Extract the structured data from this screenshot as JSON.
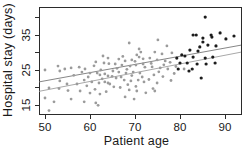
{
  "chart_data": {
    "type": "scatter",
    "title": "",
    "xlabel": "Patient age",
    "ylabel": "Hospital stay (days)",
    "xlim": [
      48.5,
      93.5
    ],
    "ylim": [
      12,
      43
    ],
    "x_ticks": [
      50,
      60,
      70,
      80,
      90
    ],
    "y_ticks": [
      15,
      20,
      25,
      30,
      35,
      40
    ],
    "y_labeled_ticks": [
      15,
      25,
      35
    ],
    "grid": false,
    "legend": "none",
    "frame_color": "#2b2b2b",
    "text_color": "#1a1a1a",
    "series": [
      {
        "name": "younger-patients-gray",
        "color": "#9b9b9b",
        "marker": "circle",
        "marker_radius": 1.4,
        "points": [
          [
            50.0,
            25.0
          ],
          [
            52.9,
            26.1
          ],
          [
            53.3,
            24.7
          ],
          [
            54.4,
            25.3
          ],
          [
            55.8,
            25.6
          ],
          [
            53.3,
            21.9
          ],
          [
            54.9,
            21.0
          ],
          [
            50.9,
            19.9
          ],
          [
            53.1,
            19.7
          ],
          [
            55.1,
            19.1
          ],
          [
            50.0,
            17.0
          ],
          [
            52.0,
            15.9
          ],
          [
            55.8,
            16.7
          ],
          [
            50.9,
            13.4
          ],
          [
            62.9,
            29.0
          ],
          [
            64.0,
            28.4
          ],
          [
            61.3,
            27.3
          ],
          [
            63.1,
            27.0
          ],
          [
            58.9,
            25.3
          ],
          [
            58.2,
            24.4
          ],
          [
            60.0,
            24.1
          ],
          [
            61.6,
            24.1
          ],
          [
            62.2,
            23.6
          ],
          [
            63.3,
            23.9
          ],
          [
            64.0,
            23.3
          ],
          [
            58.7,
            22.1
          ],
          [
            60.4,
            21.6
          ],
          [
            62.0,
            21.3
          ],
          [
            63.3,
            21.6
          ],
          [
            64.0,
            21.3
          ],
          [
            57.8,
            19.0
          ],
          [
            60.0,
            18.4
          ],
          [
            62.2,
            18.1
          ],
          [
            58.7,
            15.9
          ],
          [
            61.3,
            15.6
          ],
          [
            61.8,
            14.9
          ],
          [
            68.7,
            32.7
          ],
          [
            70.9,
            31.0
          ],
          [
            71.3,
            30.1
          ],
          [
            70.4,
            29.3
          ],
          [
            70.9,
            28.7
          ],
          [
            66.4,
            28.1
          ],
          [
            67.8,
            27.6
          ],
          [
            69.3,
            27.9
          ],
          [
            65.6,
            26.7
          ],
          [
            67.1,
            26.4
          ],
          [
            68.9,
            26.1
          ],
          [
            70.2,
            26.4
          ],
          [
            71.8,
            26.7
          ],
          [
            65.1,
            24.7
          ],
          [
            66.4,
            24.4
          ],
          [
            68.0,
            24.1
          ],
          [
            69.6,
            24.4
          ],
          [
            71.1,
            24.1
          ],
          [
            65.8,
            22.7
          ],
          [
            67.6,
            22.1
          ],
          [
            69.1,
            21.9
          ],
          [
            70.7,
            22.1
          ],
          [
            72.0,
            21.6
          ],
          [
            66.7,
            20.0
          ],
          [
            68.7,
            19.3
          ],
          [
            70.4,
            19.0
          ],
          [
            67.8,
            17.3
          ],
          [
            69.8,
            16.7
          ],
          [
            75.1,
            33.6
          ],
          [
            77.1,
            31.9
          ],
          [
            74.4,
            30.1
          ],
          [
            76.0,
            29.6
          ],
          [
            78.2,
            29.9
          ],
          [
            73.3,
            28.4
          ],
          [
            74.9,
            27.9
          ],
          [
            76.7,
            27.6
          ],
          [
            73.8,
            25.9
          ],
          [
            75.6,
            25.6
          ],
          [
            77.3,
            25.3
          ],
          [
            74.2,
            23.6
          ],
          [
            76.2,
            23.1
          ],
          [
            74.9,
            21.3
          ],
          [
            74.0,
            19.7
          ],
          [
            74.4,
            19.0
          ],
          [
            80.9,
            25.3
          ],
          [
            56.4,
            23.5
          ],
          [
            57.1,
            21.0
          ],
          [
            57.6,
            25.8
          ],
          [
            59.3,
            20.5
          ],
          [
            59.6,
            23.0
          ],
          [
            60.9,
            26.2
          ],
          [
            61.1,
            19.5
          ],
          [
            62.4,
            25.0
          ],
          [
            62.7,
            22.5
          ],
          [
            63.6,
            18.8
          ],
          [
            64.2,
            26.8
          ],
          [
            64.4,
            21.0
          ],
          [
            64.9,
            23.2
          ],
          [
            65.3,
            20.2
          ],
          [
            66.0,
            25.5
          ],
          [
            66.9,
            23.0
          ],
          [
            67.3,
            28.9
          ],
          [
            68.2,
            25.2
          ],
          [
            68.4,
            20.8
          ],
          [
            69.3,
            23.4
          ],
          [
            70.0,
            27.5
          ],
          [
            70.2,
            20.3
          ],
          [
            71.6,
            23.0
          ],
          [
            71.8,
            28.2
          ],
          [
            72.2,
            25.8
          ],
          [
            72.4,
            18.5
          ],
          [
            73.1,
            22.3
          ],
          [
            73.6,
            26.9
          ],
          [
            75.3,
            24.5
          ],
          [
            76.4,
            26.5
          ],
          [
            77.8,
            27.2
          ],
          [
            78.7,
            24.0
          ],
          [
            79.1,
            26.0
          ],
          [
            78.0,
            22.0
          ]
        ]
      },
      {
        "name": "older-patients-black",
        "color": "#1c1c1c",
        "marker": "circle",
        "marker_radius": 1.6,
        "points": [
          [
            79.3,
            28.4
          ],
          [
            79.6,
            25.3
          ],
          [
            80.0,
            27.0
          ],
          [
            80.4,
            29.3
          ],
          [
            81.1,
            29.0
          ],
          [
            81.6,
            27.0
          ],
          [
            82.0,
            24.7
          ],
          [
            82.2,
            30.7
          ],
          [
            82.7,
            25.3
          ],
          [
            82.9,
            35.0
          ],
          [
            82.9,
            28.7
          ],
          [
            83.6,
            35.0
          ],
          [
            83.8,
            26.7
          ],
          [
            84.0,
            30.4
          ],
          [
            84.4,
            31.6
          ],
          [
            84.7,
            22.7
          ],
          [
            85.1,
            34.1
          ],
          [
            85.1,
            33.0
          ],
          [
            85.6,
            40.1
          ],
          [
            85.6,
            28.4
          ],
          [
            85.8,
            26.7
          ],
          [
            86.2,
            32.1
          ],
          [
            86.9,
            35.0
          ],
          [
            87.1,
            34.4
          ],
          [
            87.3,
            28.7
          ],
          [
            87.8,
            27.0
          ],
          [
            88.0,
            31.9
          ],
          [
            88.9,
            35.6
          ],
          [
            90.2,
            33.9
          ],
          [
            92.0,
            34.7
          ]
        ]
      }
    ],
    "lines": [
      {
        "name": "regression-line-upper",
        "color": "#787878",
        "width": 0.9,
        "x": [
          48.67,
          93.56
        ],
        "y": [
          21.6,
          32.1
        ]
      },
      {
        "name": "regression-line-lower",
        "color": "#9e9e9e",
        "width": 0.9,
        "x": [
          48.67,
          93.56
        ],
        "y": [
          18.9,
          30.1
        ]
      }
    ]
  }
}
